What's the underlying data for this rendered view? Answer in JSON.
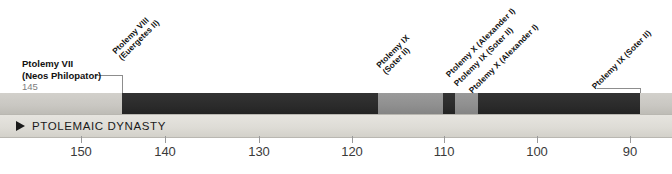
{
  "timeline": {
    "dynasty": {
      "label": "PTOLEMAIC DYNASTY",
      "marker_icon": "right-triangle-icon"
    },
    "axis": {
      "unit": "BC",
      "direction": "descending",
      "ticks": [
        {
          "value": "150",
          "x": 81
        },
        {
          "value": "140",
          "x": 165
        },
        {
          "value": "130",
          "x": 259
        },
        {
          "value": "120",
          "x": 352
        },
        {
          "value": "110",
          "x": 444
        },
        {
          "value": "100",
          "x": 537
        },
        {
          "value": "90",
          "x": 630
        }
      ]
    },
    "colors": {
      "light_segment": "#c9c7c2",
      "mid_segment": "#8f8f8f",
      "dark_segment": "#2b2b2b",
      "band_background": "#dedcd6",
      "leader_line": "#8d8d8d",
      "text": "#111111",
      "muted_text": "#7d7d7d"
    },
    "segments": [
      {
        "name": "segment-light-start",
        "x": 0,
        "width": 122,
        "tone": "light"
      },
      {
        "name": "segment-dark-1",
        "x": 122,
        "width": 256,
        "tone": "dark"
      },
      {
        "name": "segment-mid-1",
        "x": 378,
        "width": 65,
        "tone": "mid"
      },
      {
        "name": "segment-dark-2",
        "x": 443,
        "width": 12,
        "tone": "dark"
      },
      {
        "name": "segment-mid-2",
        "x": 455,
        "width": 23,
        "tone": "mid"
      },
      {
        "name": "segment-dark-3",
        "x": 478,
        "width": 162,
        "tone": "dark"
      },
      {
        "name": "segment-light-end",
        "x": 640,
        "width": 32,
        "tone": "light"
      }
    ],
    "rulers": [
      {
        "id": "ptolemy-vii",
        "name": "Ptolemy VII",
        "epithet": "(Neos Philopator)",
        "year": "145",
        "orientation": "horizontal"
      },
      {
        "id": "ptolemy-viii",
        "line1": "Ptolemy VIII",
        "line2": "(Euergetes II)",
        "orientation": "rotated"
      },
      {
        "id": "ptolemy-ix-soter-ii-1",
        "line1": "Ptolemy IX",
        "line2": "(Soter II)",
        "orientation": "rotated"
      },
      {
        "id": "ptolemy-x-alexander-i-1",
        "line1": "Ptolemy X (Alexander I)",
        "line2": "",
        "orientation": "rotated"
      },
      {
        "id": "ptolemy-ix-soter-ii-2",
        "line1": "Ptolemy IX (Soter II)",
        "line2": "",
        "orientation": "rotated"
      },
      {
        "id": "ptolemy-x-alexander-i-2",
        "line1": "Ptolemy X (Alexander I)",
        "line2": "",
        "orientation": "rotated"
      },
      {
        "id": "ptolemy-ix-soter-ii-3",
        "line1": "Ptolemy IX (Soter II)",
        "line2": "",
        "orientation": "rotated"
      }
    ]
  }
}
